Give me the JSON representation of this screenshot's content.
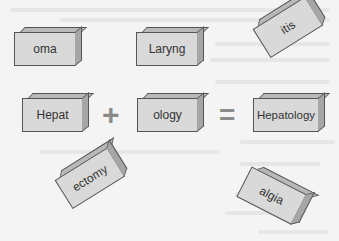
{
  "figure": {
    "blocks": {
      "oma": "oma",
      "laryng": "Laryng",
      "itis": "itis",
      "hepat": "Hepat",
      "ology": "ology",
      "hepatology": "Hepatology",
      "ectomy": "ectomy",
      "algia": "algia"
    },
    "operators": {
      "plus": "+",
      "equals": "="
    }
  },
  "colors": {
    "background": "#f4f4f4",
    "block_face": "#d9d9d9",
    "block_top": "#b9b9b9",
    "block_side": "#a6a6a6",
    "outline": "#555555",
    "operator": "#8a8a8a"
  }
}
